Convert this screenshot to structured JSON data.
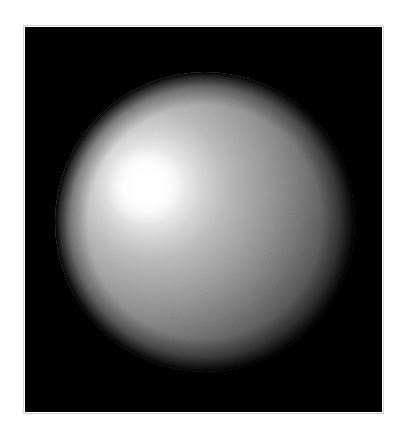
{
  "figure": {
    "title": "",
    "background_color": "#ffffff",
    "canvas_color": "#000000",
    "frame_color": "#d4d4d4",
    "canvas": {
      "x": 25,
      "y": 27,
      "width": 357,
      "height": 385
    }
  },
  "chart_data": {
    "type": "scatter",
    "title": "",
    "subtitle": "",
    "xlabel": "",
    "ylabel": "",
    "grid": false,
    "legend": null,
    "render_style": "phong-shaded sphere with polar wireframe mesh",
    "sphere": {
      "center_x": 180,
      "center_y": 195,
      "radius": 150,
      "pole_x": 182,
      "pole_y": 165,
      "surface_color": "#b4b4b4",
      "wire_color": "#3c3c3c",
      "limb_color": "#000000",
      "mesh": {
        "meridians": 36,
        "parallels": 22,
        "projection": "orthographic",
        "pole_visible": true,
        "pole_offset_x": 2,
        "pole_offset_y": -30
      },
      "lighting": {
        "model": "phong",
        "light_x": 125,
        "light_y": 158,
        "ambient": 0.06,
        "diffuse": 0.78,
        "specular": 0.95,
        "specular_radius": 62,
        "highlight_color": "#ffffff",
        "terminator_color": "#000000"
      }
    },
    "x": [],
    "y": [],
    "values": [],
    "categories": []
  },
  "axes": {
    "xlim": [
      0,
      357
    ],
    "ylim": [
      0,
      385
    ],
    "xticks": [],
    "yticks": [],
    "xticklabels": [],
    "yticklabels": []
  },
  "annotations": []
}
